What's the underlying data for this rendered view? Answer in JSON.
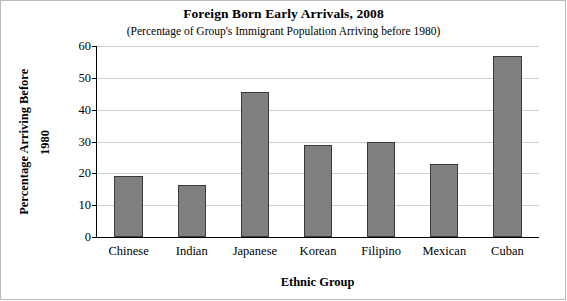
{
  "chart_data": {
    "type": "bar",
    "title": "Foreign Born Early Arrivals, 2008",
    "subtitle": "(Percentage of Group's Immigrant Population Arriving before 1980)",
    "xlabel": "Ethnic Group",
    "ylabel_line1": "Percentage Arriving Before",
    "ylabel_line2": "1980",
    "categories": [
      "Chinese",
      "Indian",
      "Japanese",
      "Korean",
      "Filipino",
      "Mexican",
      "Cuban"
    ],
    "values": [
      19.3,
      16.2,
      45.5,
      29,
      30,
      23,
      57
    ],
    "ylim": [
      0,
      60
    ],
    "yticks": [
      0,
      10,
      20,
      30,
      40,
      50,
      60
    ],
    "ytick_labels": [
      "0",
      "10",
      "20",
      "30",
      "40",
      "50",
      "60"
    ],
    "grid": true,
    "legend": "none",
    "bar_color": "#808080",
    "bar_edge_color": "#3a3a3a"
  }
}
